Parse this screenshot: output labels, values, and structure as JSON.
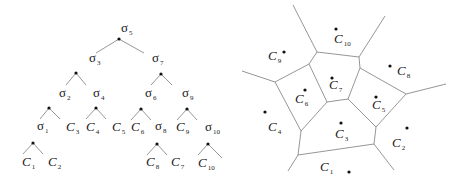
{
  "tree": {
    "nodes": [
      {
        "id": "s5",
        "name": "σ",
        "sub": "5",
        "lx": 121,
        "ly": 32,
        "dx": 119,
        "dy": 39
      },
      {
        "id": "s3",
        "name": "σ",
        "sub": "3",
        "lx": 89,
        "ly": 62,
        "dx": 76,
        "dy": 73
      },
      {
        "id": "s7",
        "name": "σ",
        "sub": "7",
        "lx": 152,
        "ly": 62,
        "dx": 161,
        "dy": 74
      },
      {
        "id": "s2",
        "name": "σ",
        "sub": "2",
        "lx": 59,
        "ly": 97,
        "dx": 49,
        "dy": 108
      },
      {
        "id": "s4",
        "name": "σ",
        "sub": "4",
        "lx": 93,
        "ly": 97,
        "dx": 96,
        "dy": 108
      },
      {
        "id": "s6",
        "name": "σ",
        "sub": "6",
        "lx": 145,
        "ly": 97,
        "dx": 141,
        "dy": 109
      },
      {
        "id": "s9",
        "name": "σ",
        "sub": "9",
        "lx": 182,
        "ly": 97,
        "dx": 187,
        "dy": 109
      },
      {
        "id": "s1",
        "name": "σ",
        "sub": "1",
        "lx": 37,
        "ly": 130,
        "dx": 33,
        "dy": 143
      },
      {
        "id": "s8",
        "name": "σ",
        "sub": "8",
        "lx": 155,
        "ly": 130,
        "dx": 157,
        "dy": 144
      },
      {
        "id": "s10",
        "name": "σ",
        "sub": "10",
        "lx": 205,
        "ly": 131,
        "dx": 208,
        "dy": 144
      }
    ],
    "leaves": [
      {
        "id": "C1",
        "name": "C",
        "sub": "1",
        "lx": 22,
        "ly": 166
      },
      {
        "id": "C2",
        "name": "C",
        "sub": "2",
        "lx": 48,
        "ly": 166
      },
      {
        "id": "C3",
        "name": "C",
        "sub": "3",
        "lx": 66,
        "ly": 131
      },
      {
        "id": "C4",
        "name": "C",
        "sub": "4",
        "lx": 86,
        "ly": 131
      },
      {
        "id": "C5",
        "name": "C",
        "sub": "5",
        "lx": 112,
        "ly": 131
      },
      {
        "id": "C6",
        "name": "C",
        "sub": "6",
        "lx": 131,
        "ly": 131
      },
      {
        "id": "C9",
        "name": "C",
        "sub": "9",
        "lx": 176,
        "ly": 131
      },
      {
        "id": "C8",
        "name": "C",
        "sub": "8",
        "lx": 146,
        "ly": 166
      },
      {
        "id": "C7",
        "name": "C",
        "sub": "7",
        "lx": 171,
        "ly": 166
      },
      {
        "id": "C10",
        "name": "C",
        "sub": "10",
        "lx": 198,
        "ly": 167
      }
    ],
    "edges": [
      [
        119,
        39,
        96,
        53
      ],
      [
        119,
        39,
        144,
        53
      ],
      [
        76,
        73,
        66,
        85
      ],
      [
        76,
        73,
        86,
        85
      ],
      [
        161,
        74,
        151,
        85
      ],
      [
        161,
        74,
        172,
        85
      ],
      [
        49,
        108,
        40,
        119
      ],
      [
        49,
        108,
        60,
        119
      ],
      [
        96,
        108,
        86,
        119
      ],
      [
        96,
        108,
        106,
        119
      ],
      [
        141,
        109,
        131,
        120
      ],
      [
        141,
        109,
        151,
        120
      ],
      [
        187,
        109,
        177,
        120
      ],
      [
        187,
        109,
        197,
        120
      ],
      [
        33,
        143,
        23,
        154
      ],
      [
        33,
        143,
        43,
        154
      ],
      [
        157,
        144,
        147,
        155
      ],
      [
        157,
        144,
        167,
        155
      ],
      [
        208,
        144,
        198,
        155
      ],
      [
        208,
        144,
        222,
        158
      ]
    ]
  },
  "voronoi": {
    "edges": [
      [
        293,
        5,
        317,
        52
      ],
      [
        385,
        16,
        359,
        57
      ],
      [
        317,
        52,
        359,
        57
      ],
      [
        317,
        52,
        309,
        64
      ],
      [
        359,
        57,
        360,
        68
      ],
      [
        242,
        71,
        275,
        82
      ],
      [
        275,
        82,
        309,
        64
      ],
      [
        309,
        64,
        327,
        102
      ],
      [
        360,
        68,
        348,
        99
      ],
      [
        327,
        102,
        348,
        99
      ],
      [
        360,
        68,
        406,
        94
      ],
      [
        406,
        94,
        446,
        84
      ],
      [
        275,
        82,
        301,
        131
      ],
      [
        301,
        131,
        327,
        102
      ],
      [
        348,
        99,
        376,
        127
      ],
      [
        376,
        127,
        406,
        94
      ],
      [
        301,
        131,
        298,
        155
      ],
      [
        376,
        127,
        374,
        144
      ],
      [
        298,
        155,
        374,
        144
      ],
      [
        298,
        155,
        288,
        171
      ],
      [
        374,
        144,
        394,
        170
      ]
    ],
    "sites": [
      {
        "id": "C10",
        "name": "C",
        "sub": "10",
        "dx": 336,
        "dy": 29,
        "lx": 334,
        "ly": 43
      },
      {
        "id": "C9",
        "name": "C",
        "sub": "9",
        "dx": 284,
        "dy": 52,
        "lx": 268,
        "ly": 60
      },
      {
        "id": "C8",
        "name": "C",
        "sub": "8",
        "dx": 390,
        "dy": 66,
        "lx": 397,
        "ly": 75
      },
      {
        "id": "C7",
        "name": "C",
        "sub": "7",
        "dx": 332,
        "dy": 78,
        "lx": 329,
        "ly": 89
      },
      {
        "id": "C6",
        "name": "C",
        "sub": "6",
        "dx": 305,
        "dy": 90,
        "lx": 295,
        "ly": 103
      },
      {
        "id": "C5",
        "name": "C",
        "sub": "5",
        "dx": 376,
        "dy": 97,
        "lx": 372,
        "ly": 109
      },
      {
        "id": "C4",
        "name": "C",
        "sub": "4",
        "dx": 265,
        "dy": 112,
        "lx": 268,
        "ly": 131
      },
      {
        "id": "C3",
        "name": "C",
        "sub": "3",
        "dx": 341,
        "dy": 123,
        "lx": 335,
        "ly": 138
      },
      {
        "id": "C2",
        "name": "C",
        "sub": "2",
        "dx": 407,
        "dy": 128,
        "lx": 392,
        "ly": 147
      },
      {
        "id": "C1",
        "name": "C",
        "sub": "1",
        "dx": 349,
        "dy": 172,
        "lx": 320,
        "ly": 171
      }
    ]
  }
}
